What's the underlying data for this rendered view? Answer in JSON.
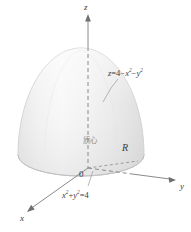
{
  "figure": {
    "axes": {
      "z_label": "z",
      "y_label": "y",
      "x_label": "x",
      "origin_label": "0"
    },
    "labels": {
      "surface_equation": "z = 4 − x² − y²",
      "surface_equation_parts": {
        "lhs": "z",
        "eq": "=",
        "const": "4",
        "minus1": "−",
        "x": "x",
        "x_exp": "2",
        "minus2": "−",
        "y": "y",
        "y_exp": "2"
      },
      "base_equation": "x² + y² = 4",
      "base_equation_parts": {
        "x": "x",
        "x_exp": "2",
        "plus": "+",
        "y": "y",
        "y_exp": "2",
        "eq": "=",
        "const": "4"
      },
      "region_label": "R",
      "centroid_label": "质心"
    },
    "colors": {
      "background": "#ffffff",
      "surface_light": "#f2f2f2",
      "surface_mid": "#e6e6e6",
      "surface_shadow": "#d8d8d8",
      "base_ellipse": "#dcdcdc",
      "base_ellipse_edge": "#bdbdbd",
      "axis_line": "#8a8a8a",
      "dashed_line": "#8a8a8a",
      "text": "#3a3a3a",
      "leader_line": "#9a9a9a"
    },
    "geometry": {
      "origin": {
        "x": 88,
        "y": 168
      },
      "apex": {
        "x": 88,
        "y": 48
      },
      "base_center": {
        "x": 81,
        "y": 155
      },
      "base_rx": 63,
      "base_ry": 21,
      "z_axis_top": {
        "x": 88,
        "y": 14
      },
      "y_axis_end": {
        "x": 176,
        "y": 180
      },
      "x_axis_end": {
        "x": 27,
        "y": 212
      }
    }
  }
}
